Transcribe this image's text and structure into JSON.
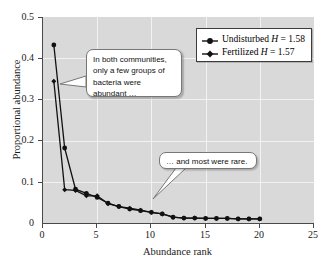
{
  "chart_data": {
    "type": "line",
    "title": "",
    "xlabel": "Abundance rank",
    "ylabel": "Proportional abundance",
    "xlim": [
      0,
      25
    ],
    "ylim": [
      0,
      0.5
    ],
    "xticks": [
      "0",
      "5",
      "10",
      "15",
      "20",
      "25"
    ],
    "xtick_values": [
      0,
      5,
      10,
      15,
      20,
      25
    ],
    "yticks": [
      "0",
      "0.1",
      "0.2",
      "0.3",
      "0.4",
      "0.5"
    ],
    "ytick_values": [
      0,
      0.1,
      0.2,
      0.3,
      0.4,
      0.5
    ],
    "grid": true,
    "legend_position": "top-right",
    "plot_background": "#d9d9d9",
    "grid_color": "#f2f2f2",
    "series_color": "#111111",
    "x": [
      1,
      2,
      3,
      4,
      5,
      6,
      7,
      8,
      9,
      10,
      11,
      12,
      13,
      14,
      15,
      16,
      17,
      18,
      19,
      20
    ],
    "series": [
      {
        "name": "Undisturbed",
        "diversity_label": "H = 1.58",
        "marker": "circle",
        "values": [
          0.432,
          0.182,
          0.082,
          0.072,
          0.062,
          0.048,
          0.04,
          0.034,
          0.03,
          0.026,
          0.022,
          0.014,
          0.012,
          0.012,
          0.011,
          0.011,
          0.011,
          0.01,
          0.01,
          0.01
        ]
      },
      {
        "name": "Fertilized",
        "diversity_label": "H = 1.57",
        "marker": "diamond",
        "values": [
          0.344,
          0.081,
          0.079,
          0.066,
          0.066,
          0.047,
          0.04,
          0.036,
          0.031,
          0.026,
          0.022,
          0.014,
          0.012,
          0.012,
          0.011,
          0.011,
          0.011,
          0.01,
          0.01,
          0.01
        ]
      }
    ]
  },
  "legend": {
    "items": [
      {
        "label": "Undisturbed",
        "stat": "H",
        "equals": " = 1.58"
      },
      {
        "label": "Fertilized",
        "stat": "H",
        "equals": " = 1.57"
      }
    ]
  },
  "callouts": [
    {
      "id": "callout-1",
      "line1": "In both communities,",
      "line2": "only a few groups of",
      "line3": "bacteria were",
      "line4": "abundant …"
    },
    {
      "id": "callout-2",
      "line1": "… and most were rare."
    }
  ]
}
